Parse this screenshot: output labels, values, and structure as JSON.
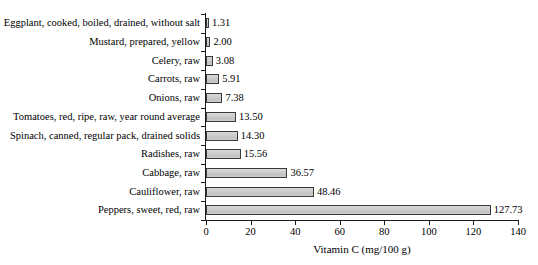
{
  "chart_data": {
    "type": "bar",
    "orientation": "horizontal",
    "title": "",
    "xlabel": "Vitamin C (mg/100 g)",
    "ylabel": "",
    "xlim": [
      0,
      140
    ],
    "xticks": [
      0,
      20,
      40,
      60,
      80,
      100,
      120,
      140
    ],
    "xtick_labels": [
      "0",
      "20",
      "40",
      "60",
      "80",
      "100",
      "120",
      "140"
    ],
    "grid": false,
    "legend": false,
    "bar_fill_color": "#c9c9c9",
    "bar_edge_color": "#3a3a3a",
    "axis_color": "#1a1a1a",
    "categories": [
      "Eggplant, cooked, boiled, drained, without salt",
      "Mustard, prepared, yellow",
      "Celery, raw",
      "Carrots, raw",
      "Onions, raw",
      "Tomatoes, red, ripe, raw, year round average",
      "Spinach, canned, regular pack, drained solids",
      "Radishes, raw",
      "Cabbage, raw",
      "Cauliflower, raw",
      "Peppers, sweet, red, raw"
    ],
    "values": [
      1.31,
      2.0,
      3.08,
      5.91,
      7.38,
      13.5,
      14.3,
      15.56,
      36.57,
      48.46,
      127.73
    ],
    "value_labels": [
      "1.31",
      "2.00",
      "3.08",
      "5.91",
      "7.38",
      "13.50",
      "14.30",
      "15.56",
      "36.57",
      "48.46",
      "127.73"
    ]
  }
}
